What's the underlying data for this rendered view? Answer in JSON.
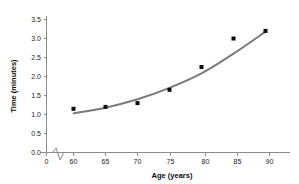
{
  "chart_data": {
    "type": "scatter",
    "title": "",
    "xlabel": "Age (years)",
    "ylabel": "Time (minutes)",
    "x": [
      60,
      65,
      70,
      75,
      80,
      85,
      90
    ],
    "values": [
      1.15,
      1.2,
      1.3,
      1.65,
      2.25,
      3.0,
      3.2
    ],
    "series": [
      {
        "name": "Observed time",
        "type": "scatter",
        "x": [
          60,
          65,
          70,
          75,
          80,
          85,
          90
        ],
        "values": [
          1.15,
          1.2,
          1.3,
          1.65,
          2.25,
          3.0,
          3.2
        ]
      },
      {
        "name": "Fitted curve",
        "type": "line",
        "x": [
          60,
          65,
          70,
          75,
          80,
          85,
          90
        ],
        "values": [
          1.03,
          1.18,
          1.4,
          1.7,
          2.08,
          2.6,
          3.18
        ]
      }
    ],
    "xticks": [
      "0",
      "60",
      "65",
      "70",
      "75",
      "80",
      "85",
      "90"
    ],
    "xtick_values": [
      0,
      60,
      65,
      70,
      75,
      80,
      85,
      90
    ],
    "yticks": [
      "0.0",
      "0.5",
      "1.0",
      "1.5",
      "2.0",
      "2.5",
      "3.0",
      "3.5"
    ],
    "ytick_values": [
      0.0,
      0.5,
      1.0,
      1.5,
      2.0,
      2.5,
      3.0,
      3.5
    ],
    "xlim": [
      0,
      92.5
    ],
    "ylim": [
      0,
      3.6
    ],
    "grid": false,
    "legend": "none",
    "axis_break": true,
    "colors": {
      "point": "#0a0a0a",
      "curve": "#7a7a7a",
      "axis": "#8c8c8c",
      "text": "#1b1b1b",
      "background": "#ffffff"
    }
  }
}
